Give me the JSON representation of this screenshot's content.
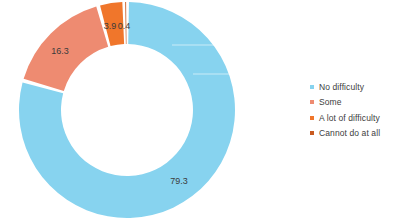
{
  "chart_data": {
    "type": "pie",
    "variant": "donut",
    "title": "",
    "subtitle": "",
    "xlabel": "",
    "ylabel": "",
    "units": "percent",
    "grid": false,
    "legend_position": "right",
    "start_angle_deg": 0,
    "direction": "clockwise",
    "total": 99.9,
    "categories": [
      "No difficulty",
      "Some",
      "A lot of difficulty",
      "Cannot do at all"
    ],
    "values": [
      79.3,
      16.3,
      3.9,
      0.4
    ],
    "colors": [
      "#87D3EF",
      "#EE8B71",
      "#F0762B",
      "#C85A20"
    ],
    "data_labels": [
      "79.3",
      "16.3",
      "3.9",
      "0.4"
    ],
    "slices": [
      {
        "label": "No difficulty",
        "value": 79.3,
        "data_label": "79.3",
        "color": "#87D3EF"
      },
      {
        "label": "Some",
        "value": 16.3,
        "data_label": "16.3",
        "color": "#EE8B71"
      },
      {
        "label": "A lot of difficulty",
        "value": 3.9,
        "data_label": "3.9",
        "color": "#F0762B"
      },
      {
        "label": "Cannot do at all",
        "value": 0.4,
        "data_label": "0.4",
        "color": "#C85A20"
      }
    ]
  },
  "legend": {
    "items": [
      {
        "label": "No difficulty",
        "color": "#87D3EF",
        "marker": "square-marker-icon"
      },
      {
        "label": "Some",
        "color": "#EE8B71",
        "marker": "square-marker-icon"
      },
      {
        "label": "A lot of difficulty",
        "color": "#F0762B",
        "marker": "square-marker-icon"
      },
      {
        "label": "Cannot do at all",
        "color": "#C85A20",
        "marker": "square-marker-icon"
      }
    ]
  },
  "labels": {
    "no_difficulty": "79.3",
    "some": "16.3",
    "a_lot_of_difficulty": "3.9",
    "cannot_do_at_all": "0.4"
  }
}
